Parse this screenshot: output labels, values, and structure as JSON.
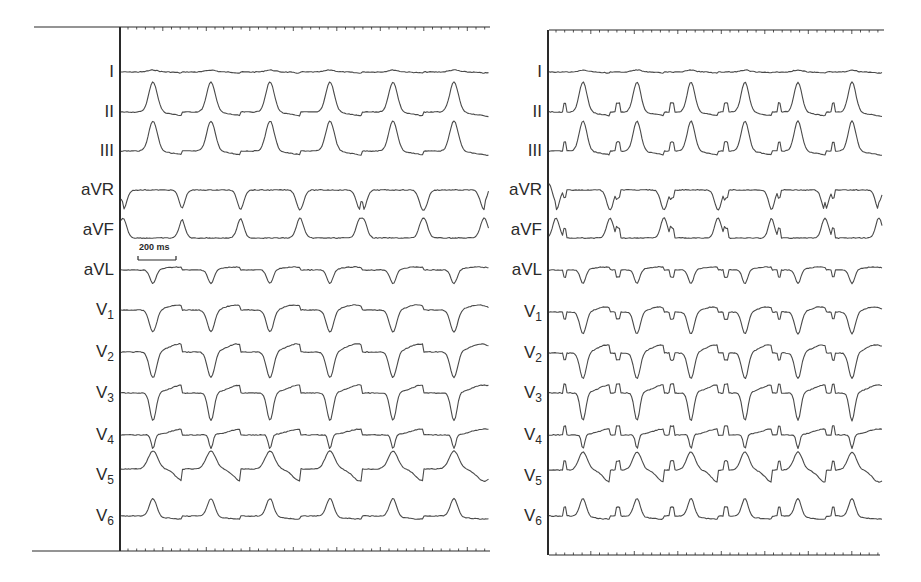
{
  "figure": {
    "panels": [
      {
        "id": "left",
        "axis_x": 120,
        "trace_start": 121,
        "trace_end": 489,
        "top_line": {
          "x1": 34,
          "x2": 490,
          "y": 27
        },
        "bottom_line": {
          "x1": 32,
          "x2": 490,
          "y": 551
        },
        "beats_x": [
          153,
          211,
          270,
          330,
          393,
          454
        ],
        "paced": false
      },
      {
        "id": "right",
        "axis_x": 548,
        "trace_start": 549,
        "trace_end": 882,
        "top_line": {
          "x1": 549,
          "x2": 884,
          "y": 30
        },
        "bottom_line": {
          "x1": 549,
          "x2": 880,
          "y": 555
        },
        "beats_x": [
          583,
          637,
          691,
          745,
          798,
          852
        ],
        "paced": true,
        "pacing_spikes_x": [
          565,
          618,
          672,
          726,
          779,
          833
        ]
      }
    ],
    "leads": [
      {
        "name": "I",
        "sub": "",
        "y_left": 72,
        "y_right": 72
      },
      {
        "name": "II",
        "sub": "",
        "y_left": 112,
        "y_right": 112
      },
      {
        "name": "III",
        "sub": "",
        "y_left": 151,
        "y_right": 151
      },
      {
        "name": "aVR",
        "sub": "",
        "y_left": 190,
        "y_right": 190
      },
      {
        "name": "aVF",
        "sub": "",
        "y_left": 230,
        "y_right": 230
      },
      {
        "name": "aVL",
        "sub": "",
        "y_left": 270,
        "y_right": 270
      },
      {
        "name": "V",
        "sub": "1",
        "y_left": 310,
        "y_right": 312
      },
      {
        "name": "V",
        "sub": "2",
        "y_left": 352,
        "y_right": 353
      },
      {
        "name": "V",
        "sub": "3",
        "y_left": 393,
        "y_right": 393
      },
      {
        "name": "V",
        "sub": "4",
        "y_left": 435,
        "y_right": 435
      },
      {
        "name": "V",
        "sub": "5",
        "y_left": 475,
        "y_right": 476
      },
      {
        "name": "V",
        "sub": "6",
        "y_left": 516,
        "y_right": 516
      }
    ],
    "scale_bar": {
      "label": "200 ms",
      "x1": 138,
      "x2": 176,
      "y": 260,
      "label_x": 139,
      "label_y": 247
    }
  },
  "chart_data": {
    "type": "line",
    "title": "",
    "leads": [
      "I",
      "II",
      "III",
      "aVR",
      "aVF",
      "aVL",
      "V1",
      "V2",
      "V3",
      "V4",
      "V5",
      "V6"
    ],
    "scale": "200 ms",
    "panels": [
      {
        "name": "left",
        "beats": 6,
        "pacing_spikes": false
      },
      {
        "name": "right",
        "beats": 6,
        "pacing_spikes": true
      }
    ],
    "lead_morphology": {
      "I": "nearly flat, low amplitude",
      "II": "positive peaked complexes",
      "III": "positive peaked complexes",
      "aVR": "negative complexes",
      "aVF": "positive complexes",
      "aVL": "negative deflections",
      "V1": "negative QS complexes",
      "V2": "negative QS complexes",
      "V3": "negative complexes",
      "V4": "negative / biphasic",
      "V5": "positive peaked",
      "V6": "positive peaked"
    },
    "xlabel": "",
    "ylabel": ""
  },
  "colors": {
    "trace": "#4a4a4a",
    "axis": "#2a2a2a",
    "background": "#ffffff"
  }
}
